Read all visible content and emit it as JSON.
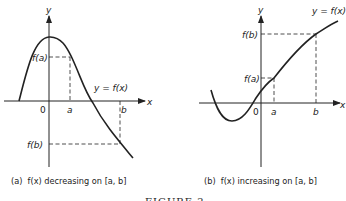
{
  "figure": {
    "title": "FIGURE 2",
    "panels": [
      {
        "id": "a",
        "caption": "(a)  f(x) decreasing on [a, b]",
        "curve_label": "y = f(x)",
        "axis_x_label": "x",
        "axis_y_label": "y",
        "origin_label": "0",
        "tick_a": "a",
        "tick_b": "b",
        "tick_fa": "f(a)",
        "tick_fb": "f(b)"
      },
      {
        "id": "b",
        "caption": "(b)  f(x) increasing on [a, b]",
        "curve_label": "y = f(x)",
        "axis_x_label": "x",
        "axis_y_label": "y",
        "origin_label": "0",
        "tick_a": "a",
        "tick_b": "b",
        "tick_fa": "f(a)",
        "tick_fb": "f(b)"
      }
    ]
  },
  "colors": {
    "ink": "#222222",
    "background": "#ffffff"
  }
}
